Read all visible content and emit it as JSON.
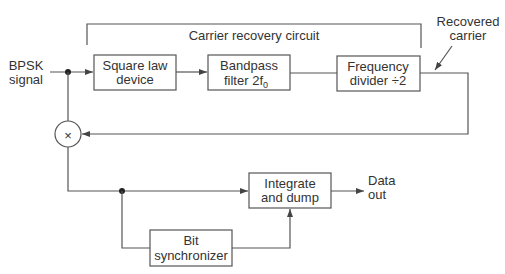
{
  "diagram": {
    "type": "block-diagram",
    "input_label": [
      "BPSK",
      "signal"
    ],
    "bracket_label": "Carrier recovery circuit",
    "recovered_carrier_label": [
      "Recovered",
      "carrier"
    ],
    "blocks": {
      "square_law": [
        "Square law",
        "device"
      ],
      "bandpass": [
        "Bandpass",
        "filter 2f",
        "0"
      ],
      "freq_divider": [
        "Frequency",
        "divider ÷2"
      ],
      "integrate_dump": [
        "Integrate",
        "and dump"
      ],
      "bit_sync": [
        "Bit",
        "synchronizer"
      ]
    },
    "output_label": [
      "Data",
      "out"
    ],
    "multiplier_symbol": "×"
  }
}
